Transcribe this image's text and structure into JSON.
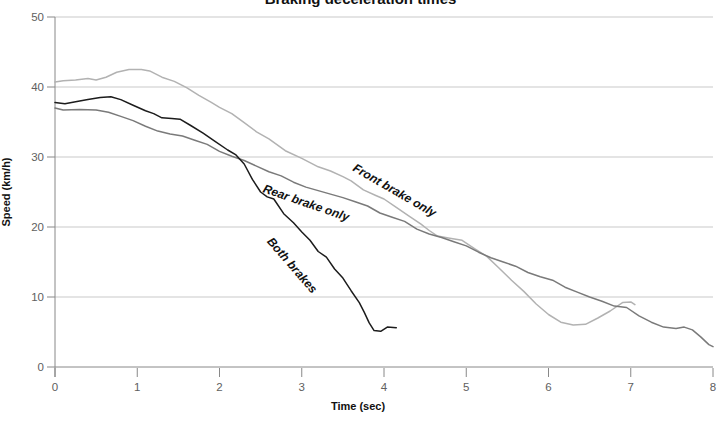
{
  "colors": {
    "background": "#ffffff",
    "gridline": "#c9c9c9",
    "axis": "#888888",
    "tick_label": "#606060",
    "text": "#111111",
    "front_brake_line": "#b2b2b2",
    "rear_brake_line": "#7a7a7a",
    "both_brakes_line": "#1c1c1c"
  },
  "chart_data": {
    "type": "line",
    "title": "Braking deceleration times",
    "xlabel": "Time (sec)",
    "ylabel": "Speed (km/h)",
    "xlim": [
      0,
      8
    ],
    "ylim": [
      0,
      50
    ],
    "x_ticks": [
      0,
      1,
      2,
      3,
      4,
      5,
      6,
      7,
      8
    ],
    "y_ticks": [
      0,
      10,
      20,
      30,
      40,
      50
    ],
    "grid": "horizontal-only",
    "legend_position": "inline-rotated-labels",
    "series": [
      {
        "name": "Front brake only",
        "color": "#b2b2b2",
        "points": [
          [
            0,
            40.7
          ],
          [
            0.1,
            40.9
          ],
          [
            0.25,
            41.0
          ],
          [
            0.4,
            41.2
          ],
          [
            0.5,
            41.0
          ],
          [
            0.62,
            41.4
          ],
          [
            0.75,
            42.1
          ],
          [
            0.9,
            42.5
          ],
          [
            1.05,
            42.5
          ],
          [
            1.15,
            42.3
          ],
          [
            1.3,
            41.4
          ],
          [
            1.45,
            40.8
          ],
          [
            1.6,
            39.9
          ],
          [
            1.75,
            38.8
          ],
          [
            1.9,
            37.8
          ],
          [
            2.0,
            37.1
          ],
          [
            2.15,
            36.2
          ],
          [
            2.3,
            34.9
          ],
          [
            2.45,
            33.6
          ],
          [
            2.6,
            32.6
          ],
          [
            2.8,
            30.9
          ],
          [
            3.0,
            29.8
          ],
          [
            3.2,
            28.6
          ],
          [
            3.35,
            28.0
          ],
          [
            3.5,
            27.2
          ],
          [
            3.6,
            26.6
          ],
          [
            3.75,
            25.3
          ],
          [
            3.9,
            24.5
          ],
          [
            4.0,
            24.0
          ],
          [
            4.15,
            22.8
          ],
          [
            4.3,
            21.6
          ],
          [
            4.45,
            20.4
          ],
          [
            4.55,
            19.5
          ],
          [
            4.65,
            18.7
          ],
          [
            4.8,
            18.4
          ],
          [
            4.95,
            18.1
          ],
          [
            5.1,
            16.9
          ],
          [
            5.25,
            15.8
          ],
          [
            5.4,
            14.1
          ],
          [
            5.55,
            12.4
          ],
          [
            5.7,
            10.8
          ],
          [
            5.85,
            9.0
          ],
          [
            6.0,
            7.5
          ],
          [
            6.15,
            6.4
          ],
          [
            6.3,
            6.0
          ],
          [
            6.45,
            6.1
          ],
          [
            6.6,
            7.0
          ],
          [
            6.75,
            8.0
          ],
          [
            6.9,
            9.2
          ],
          [
            7.0,
            9.3
          ],
          [
            7.05,
            8.9
          ]
        ]
      },
      {
        "name": "Rear brake only",
        "color": "#7a7a7a",
        "points": [
          [
            0,
            37.0
          ],
          [
            0.1,
            36.7
          ],
          [
            0.3,
            36.8
          ],
          [
            0.5,
            36.7
          ],
          [
            0.65,
            36.4
          ],
          [
            0.8,
            35.8
          ],
          [
            0.95,
            35.2
          ],
          [
            1.1,
            34.4
          ],
          [
            1.25,
            33.7
          ],
          [
            1.4,
            33.3
          ],
          [
            1.55,
            33.0
          ],
          [
            1.7,
            32.4
          ],
          [
            1.85,
            31.8
          ],
          [
            2.0,
            30.8
          ],
          [
            2.15,
            30.1
          ],
          [
            2.3,
            29.5
          ],
          [
            2.45,
            28.7
          ],
          [
            2.6,
            27.9
          ],
          [
            2.75,
            27.3
          ],
          [
            2.9,
            26.4
          ],
          [
            3.05,
            25.7
          ],
          [
            3.2,
            25.2
          ],
          [
            3.35,
            24.7
          ],
          [
            3.5,
            24.2
          ],
          [
            3.65,
            23.6
          ],
          [
            3.8,
            23.0
          ],
          [
            3.95,
            22.0
          ],
          [
            4.1,
            21.4
          ],
          [
            4.25,
            20.8
          ],
          [
            4.4,
            19.7
          ],
          [
            4.55,
            19.0
          ],
          [
            4.7,
            18.5
          ],
          [
            4.85,
            17.9
          ],
          [
            5.0,
            17.3
          ],
          [
            5.15,
            16.4
          ],
          [
            5.3,
            15.6
          ],
          [
            5.45,
            15.0
          ],
          [
            5.6,
            14.4
          ],
          [
            5.75,
            13.5
          ],
          [
            5.9,
            12.9
          ],
          [
            6.05,
            12.4
          ],
          [
            6.2,
            11.4
          ],
          [
            6.35,
            10.7
          ],
          [
            6.5,
            10.0
          ],
          [
            6.65,
            9.4
          ],
          [
            6.8,
            8.7
          ],
          [
            6.95,
            8.5
          ],
          [
            7.1,
            7.3
          ],
          [
            7.25,
            6.4
          ],
          [
            7.4,
            5.7
          ],
          [
            7.55,
            5.5
          ],
          [
            7.65,
            5.7
          ],
          [
            7.75,
            5.3
          ],
          [
            7.85,
            4.3
          ],
          [
            7.95,
            3.2
          ],
          [
            8.0,
            2.9
          ]
        ]
      },
      {
        "name": "Both brakes",
        "color": "#1c1c1c",
        "points": [
          [
            0,
            37.8
          ],
          [
            0.12,
            37.6
          ],
          [
            0.25,
            37.9
          ],
          [
            0.4,
            38.2
          ],
          [
            0.55,
            38.5
          ],
          [
            0.68,
            38.6
          ],
          [
            0.8,
            38.2
          ],
          [
            0.95,
            37.4
          ],
          [
            1.1,
            36.6
          ],
          [
            1.2,
            36.2
          ],
          [
            1.3,
            35.6
          ],
          [
            1.42,
            35.5
          ],
          [
            1.52,
            35.4
          ],
          [
            1.65,
            34.5
          ],
          [
            1.8,
            33.4
          ],
          [
            1.95,
            32.2
          ],
          [
            2.1,
            31.0
          ],
          [
            2.2,
            30.3
          ],
          [
            2.3,
            29.0
          ],
          [
            2.4,
            26.8
          ],
          [
            2.5,
            25.0
          ],
          [
            2.58,
            24.3
          ],
          [
            2.66,
            24.0
          ],
          [
            2.78,
            21.9
          ],
          [
            2.9,
            20.6
          ],
          [
            3.0,
            19.3
          ],
          [
            3.1,
            18.1
          ],
          [
            3.2,
            16.5
          ],
          [
            3.3,
            15.7
          ],
          [
            3.4,
            14.0
          ],
          [
            3.5,
            12.7
          ],
          [
            3.6,
            10.9
          ],
          [
            3.7,
            9.2
          ],
          [
            3.76,
            7.8
          ],
          [
            3.82,
            6.3
          ],
          [
            3.88,
            5.2
          ],
          [
            3.96,
            5.1
          ],
          [
            4.04,
            5.7
          ],
          [
            4.15,
            5.6
          ]
        ]
      }
    ],
    "annotations": [
      {
        "text": "Front brake only",
        "x": 3.61,
        "y": 28.1,
        "rotation": -30
      },
      {
        "text": "Rear brake only",
        "x": 2.52,
        "y": 25.0,
        "rotation": -19
      },
      {
        "text": "Both brakes",
        "x": 2.57,
        "y": 17.9,
        "rotation": -49
      }
    ]
  }
}
